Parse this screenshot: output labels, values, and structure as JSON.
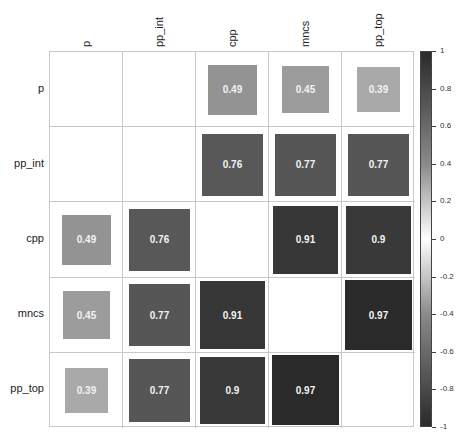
{
  "chart_data": {
    "type": "heatmap",
    "title": "",
    "variables": [
      "p",
      "pp_int",
      "cpp",
      "mncs",
      "pp_top"
    ],
    "matrix": [
      [
        null,
        null,
        0.49,
        0.45,
        0.39
      ],
      [
        null,
        null,
        0.76,
        0.77,
        0.77
      ],
      [
        0.49,
        0.76,
        null,
        0.91,
        0.9
      ],
      [
        0.45,
        0.77,
        0.91,
        null,
        0.97
      ],
      [
        0.39,
        0.77,
        0.9,
        0.97,
        null
      ]
    ],
    "labels": [
      [
        "",
        "",
        "0.49",
        "0.45",
        "0.39"
      ],
      [
        "",
        "",
        "0.76",
        "0.77",
        "0.77"
      ],
      [
        "0.49",
        "0.76",
        "",
        "0.91",
        "0.9"
      ],
      [
        "0.45",
        "0.77",
        "0.91",
        "",
        "0.97"
      ],
      [
        "0.39",
        "0.77",
        "0.9",
        "0.97",
        ""
      ]
    ],
    "colorbar": {
      "range": [
        -1,
        1
      ],
      "ticks": [
        "1",
        "0.8",
        "0.6",
        "0.4",
        "0.2",
        "0",
        "-0.2",
        "-0.4",
        "-0.6",
        "-0.8",
        "-1"
      ]
    },
    "note": "Square size and gray darkness scale with correlation magnitude; diagonal and p/pp_int block blank"
  }
}
